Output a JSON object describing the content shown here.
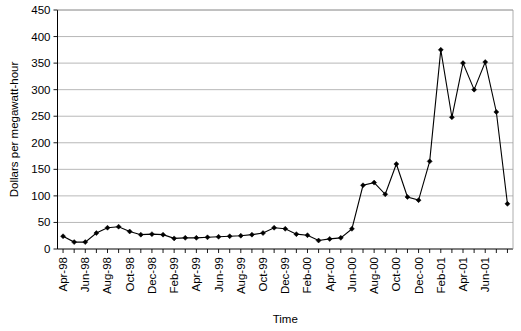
{
  "chart_data": {
    "type": "line",
    "title": "",
    "xlabel": "Time",
    "ylabel": "Dollars per megawatt-hour",
    "ylim": [
      0,
      450
    ],
    "ytick_step": 50,
    "yticks": [
      "0",
      "50",
      "100",
      "150",
      "200",
      "250",
      "300",
      "350",
      "400",
      "450"
    ],
    "grid": true,
    "legend": "none",
    "marker": "diamond",
    "xtick_labels": [
      "Apr-98",
      "Jun-98",
      "Aug-98",
      "Oct-98",
      "Dec-98",
      "Feb-99",
      "Apr-99",
      "Jun-99",
      "Aug-99",
      "Oct-99",
      "Dec-99",
      "Feb-00",
      "Apr-00",
      "Jun-00",
      "Aug-00",
      "Oct-00",
      "Dec-00",
      "Feb-01",
      "Apr-01",
      "Jun-01"
    ],
    "xtick_label_interval": 2,
    "categories": [
      "Apr-98",
      "May-98",
      "Jun-98",
      "Jul-98",
      "Aug-98",
      "Sep-98",
      "Oct-98",
      "Nov-98",
      "Dec-98",
      "Jan-99",
      "Feb-99",
      "Mar-99",
      "Apr-99",
      "May-99",
      "Jun-99",
      "Jul-99",
      "Aug-99",
      "Sep-99",
      "Oct-99",
      "Nov-99",
      "Dec-99",
      "Jan-00",
      "Feb-00",
      "Mar-00",
      "Apr-00",
      "May-00",
      "Jun-00",
      "Jul-00",
      "Aug-00",
      "Sep-00",
      "Oct-00",
      "Nov-00",
      "Dec-00",
      "Jan-01",
      "Feb-01",
      "Mar-01",
      "Apr-01",
      "May-01",
      "Jun-01",
      "Jul-01",
      "Aug-01"
    ],
    "values": [
      24,
      13,
      13,
      30,
      40,
      42,
      33,
      27,
      28,
      27,
      20,
      21,
      21,
      22,
      23,
      24,
      25,
      27,
      30,
      40,
      38,
      28,
      26,
      16,
      19,
      21,
      38,
      120,
      125,
      103,
      160,
      98,
      92,
      165,
      375,
      248,
      350,
      300,
      352,
      258,
      85
    ],
    "series_name": "Electricity price"
  }
}
